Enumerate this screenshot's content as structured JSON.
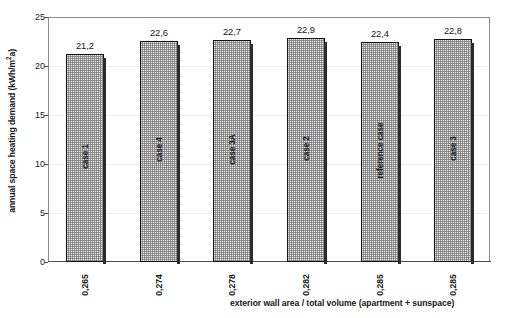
{
  "chart_data": {
    "type": "bar",
    "title": "",
    "xlabel": "exterior wall area / total volume (apartment + sunspace)",
    "ylabel": "annual space heating demand (kWh/m²a)",
    "ylabel_main": "annual space heating demand (kWh/m",
    "ylabel_sup": "2",
    "ylabel_tail": "a)",
    "ylim": [
      0,
      25
    ],
    "ytick_step": 5,
    "grid": true,
    "legend": "none",
    "categories": [
      "0,265",
      "0,274",
      "0,278",
      "0,282",
      "0,285",
      "0,285"
    ],
    "values": [
      21.2,
      22.6,
      22.7,
      22.9,
      22.4,
      22.8
    ],
    "value_labels": [
      "21,2",
      "22,6",
      "22,7",
      "22,9",
      "22,4",
      "22,8"
    ],
    "bar_labels": [
      "case 1",
      "case 4",
      "case 3A",
      "case 2",
      "reference case",
      "case 3"
    ],
    "yticks": [
      "0",
      "5",
      "10",
      "15",
      "20",
      "25"
    ],
    "ytick_values": [
      0,
      5,
      10,
      15,
      20,
      25
    ],
    "colors": {
      "bar_fill": "#e9e9e9",
      "bar_border": "#121212",
      "bar_shadow": "#2b2b2b",
      "grid": "#efefef",
      "frame": "#8a8a8a",
      "text": "#161616",
      "background": "#ffffff"
    }
  }
}
